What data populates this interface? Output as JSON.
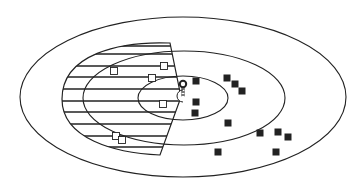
{
  "diagram": {
    "type": "concentric-ellipses-scatter",
    "background": "#ffffff",
    "stroke_color": "#222222",
    "ellipses": [
      {
        "name": "outer",
        "cx": 183,
        "cy": 97,
        "rx": 163,
        "ry": 80
      },
      {
        "name": "middle",
        "cx": 184,
        "cy": 98,
        "rx": 101,
        "ry": 47
      },
      {
        "name": "inner",
        "cx": 183,
        "cy": 98,
        "rx": 45,
        "ry": 22
      }
    ],
    "hatched_region": {
      "apex_left": [
        62,
        99
      ],
      "top_right": [
        170,
        43
      ],
      "right_mid": [
        181,
        97
      ],
      "bottom_right": [
        160,
        155
      ],
      "hatch_y": [
        46,
        54,
        66,
        77,
        89,
        101,
        112,
        124,
        136,
        147
      ]
    },
    "open_squares": [
      [
        114,
        71
      ],
      [
        164,
        66
      ],
      [
        152,
        78
      ],
      [
        163,
        104
      ],
      [
        116,
        136
      ],
      [
        122,
        140
      ]
    ],
    "filled_squares": [
      [
        196,
        81
      ],
      [
        227,
        78
      ],
      [
        235,
        84
      ],
      [
        242,
        91
      ],
      [
        196,
        102
      ],
      [
        195,
        113
      ],
      [
        228,
        123
      ],
      [
        260,
        133
      ],
      [
        278,
        132
      ],
      [
        288,
        137
      ],
      [
        218,
        152
      ],
      [
        276,
        152
      ]
    ],
    "center_marker": {
      "circle": [
        183,
        84
      ],
      "arc_center": [
        181,
        96
      ]
    }
  }
}
